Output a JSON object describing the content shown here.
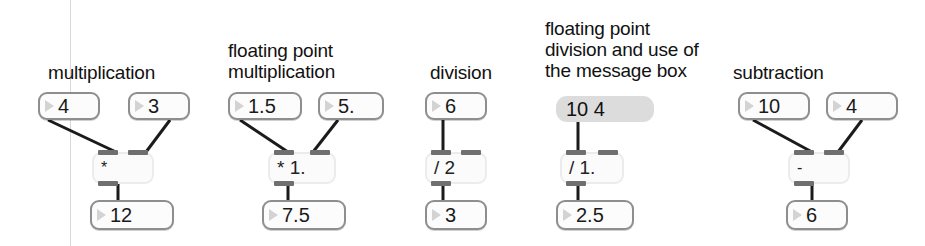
{
  "canvas": {
    "width": 925,
    "height": 246,
    "background": "#ffffff",
    "rule_color": "#d8d8d8",
    "cord_color": "#1b1b1b",
    "numbox_border": "#8e8e8e",
    "objbox_border": "#ececec",
    "msgbox_fill": "#dcdcdc",
    "nub_color": "#6f6f6f"
  },
  "sections": [
    {
      "id": "multiplication",
      "caption": "multiplication",
      "inputs": [
        "4",
        "3"
      ],
      "operator": "*",
      "result": "12"
    },
    {
      "id": "float-multiplication",
      "caption": "floating point\nmultiplication",
      "inputs": [
        "1.5",
        "5."
      ],
      "operator": "* 1.",
      "result": "7.5"
    },
    {
      "id": "division",
      "caption": "division",
      "inputs": [
        "6"
      ],
      "operator": "/ 2",
      "result": "3"
    },
    {
      "id": "float-division-message-box",
      "caption": "floating point\ndivision and use of\nthe message box",
      "message": "10 4",
      "operator": "/ 1.",
      "result": "2.5"
    },
    {
      "id": "subtraction",
      "caption": "subtraction",
      "inputs": [
        "10",
        "4"
      ],
      "operator": "-",
      "result": "6"
    }
  ]
}
